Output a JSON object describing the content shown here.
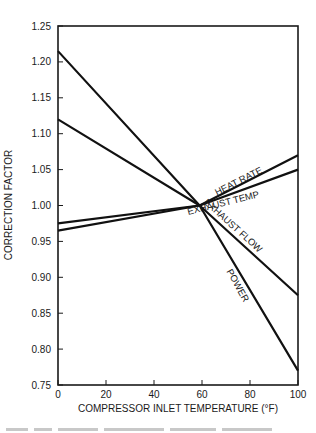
{
  "chart_data": {
    "type": "line",
    "title": "",
    "xlabel": "COMPRESSOR INLET TEMPERATURE (°F)",
    "ylabel": "CORRECTION FACTOR",
    "xlim": [
      0,
      100
    ],
    "ylim": [
      0.75,
      1.25
    ],
    "xticks": [
      0,
      20,
      40,
      60,
      80,
      100
    ],
    "yticks": [
      0.75,
      0.8,
      0.85,
      0.9,
      0.95,
      1.0,
      1.05,
      1.1,
      1.15,
      1.2,
      1.25
    ],
    "ytick_labels": [
      "0.75",
      "0.80",
      "0.85",
      "0.90",
      "0.95",
      "1.00",
      "1.05",
      "1.10",
      "1.15",
      "1.20",
      "1.25"
    ],
    "grid": false,
    "legend": "inline labels",
    "series": [
      {
        "name": "HEAT RATE",
        "x": [
          0,
          59,
          100
        ],
        "values": [
          0.975,
          1.0,
          1.07
        ]
      },
      {
        "name": "EXHAUST TEMP",
        "x": [
          0,
          59,
          100
        ],
        "values": [
          0.965,
          1.0,
          1.05
        ]
      },
      {
        "name": "EXHAUST FLOW",
        "x": [
          0,
          59,
          100
        ],
        "values": [
          1.12,
          1.0,
          0.875
        ]
      },
      {
        "name": "POWER",
        "x": [
          0,
          59,
          100
        ],
        "values": [
          1.215,
          1.0,
          0.77
        ]
      }
    ],
    "labels": [
      {
        "text": "HEAT RATE",
        "x": 240,
        "y": 184,
        "rotate": -27
      },
      {
        "text": "EXHAUST TEMP",
        "x": 224,
        "y": 206,
        "rotate": -14
      },
      {
        "text": "EXHAUST FLOW",
        "x": 231,
        "y": 228,
        "rotate": 42
      },
      {
        "text": "POWER",
        "x": 235,
        "y": 287,
        "rotate": 61
      }
    ]
  },
  "caption": "Fig. (illegible) — correction factors vs. compressor inlet temperature"
}
